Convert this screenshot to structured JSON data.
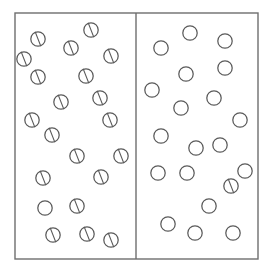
{
  "figure": {
    "type": "static-illustration",
    "canvas": {
      "width": 274,
      "height": 276,
      "background": "#ffffff"
    },
    "stroke_color": "#5a5a5a",
    "frame_color": "#6e6e6e",
    "frame": {
      "x": 15,
      "y": 13,
      "width": 243,
      "height": 246
    },
    "divider": {
      "x": 136,
      "y1": 13,
      "y2": 259
    },
    "token": {
      "radius": 7.2,
      "slash_angle_label": "upper-left to lower-right",
      "slash_dx": 2.6,
      "slash_dy": 6.6
    },
    "panels": [
      {
        "name": "left-panel",
        "label": "Left panel",
        "bounds": {
          "x": 15,
          "y": 13,
          "width": 121,
          "height": 246
        },
        "count_total": 21,
        "count_lined": 20,
        "count_plain": 1,
        "tokens": [
          {
            "cx": 38,
            "cy": 39,
            "lined": true
          },
          {
            "cx": 91,
            "cy": 30,
            "lined": true
          },
          {
            "cx": 71,
            "cy": 48,
            "lined": true
          },
          {
            "cx": 111,
            "cy": 56,
            "lined": true
          },
          {
            "cx": 38,
            "cy": 77,
            "lined": true
          },
          {
            "cx": 86,
            "cy": 76,
            "lined": true
          },
          {
            "cx": 61,
            "cy": 102,
            "lined": true
          },
          {
            "cx": 32,
            "cy": 120,
            "lined": true
          },
          {
            "cx": 110,
            "cy": 120,
            "lined": true
          },
          {
            "cx": 52,
            "cy": 135,
            "lined": true
          },
          {
            "cx": 77,
            "cy": 156,
            "lined": true
          },
          {
            "cx": 121,
            "cy": 156,
            "lined": true
          },
          {
            "cx": 43,
            "cy": 178,
            "lined": true
          },
          {
            "cx": 101,
            "cy": 177,
            "lined": true
          },
          {
            "cx": 45,
            "cy": 208,
            "lined": false
          },
          {
            "cx": 77,
            "cy": 206,
            "lined": true
          },
          {
            "cx": 53,
            "cy": 235,
            "lined": true
          },
          {
            "cx": 87,
            "cy": 234,
            "lined": true
          },
          {
            "cx": 111,
            "cy": 240,
            "lined": true
          },
          {
            "cx": 24,
            "cy": 59,
            "lined": true
          },
          {
            "cx": 100,
            "cy": 98,
            "lined": true
          }
        ]
      },
      {
        "name": "right-panel",
        "label": "Right panel",
        "bounds": {
          "x": 136,
          "y": 13,
          "width": 122,
          "height": 246
        },
        "count_total": 20,
        "count_lined": 1,
        "count_plain": 19,
        "tokens": [
          {
            "cx": 190,
            "cy": 33,
            "lined": false
          },
          {
            "cx": 225,
            "cy": 41,
            "lined": false
          },
          {
            "cx": 161,
            "cy": 48,
            "lined": false
          },
          {
            "cx": 186,
            "cy": 74,
            "lined": false
          },
          {
            "cx": 225,
            "cy": 68,
            "lined": false
          },
          {
            "cx": 152,
            "cy": 90,
            "lined": false
          },
          {
            "cx": 214,
            "cy": 98,
            "lined": false
          },
          {
            "cx": 181,
            "cy": 108,
            "lined": false
          },
          {
            "cx": 240,
            "cy": 120,
            "lined": false
          },
          {
            "cx": 161,
            "cy": 136,
            "lined": false
          },
          {
            "cx": 196,
            "cy": 148,
            "lined": false
          },
          {
            "cx": 220,
            "cy": 145,
            "lined": false
          },
          {
            "cx": 158,
            "cy": 173,
            "lined": false
          },
          {
            "cx": 187,
            "cy": 173,
            "lined": false
          },
          {
            "cx": 231,
            "cy": 186,
            "lined": true
          },
          {
            "cx": 209,
            "cy": 206,
            "lined": false
          },
          {
            "cx": 168,
            "cy": 224,
            "lined": false
          },
          {
            "cx": 195,
            "cy": 233,
            "lined": false
          },
          {
            "cx": 233,
            "cy": 233,
            "lined": false
          },
          {
            "cx": 245,
            "cy": 171,
            "lined": false
          }
        ]
      }
    ]
  }
}
